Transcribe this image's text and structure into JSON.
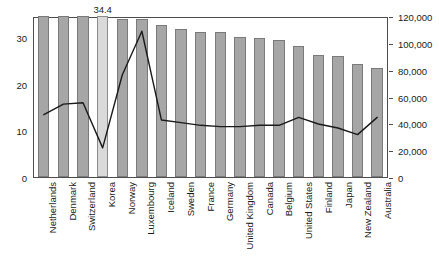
{
  "chart_data": {
    "type": "bar",
    "title": "",
    "subtitle": "",
    "xlabel": "",
    "ylabel": "",
    "categories": [
      "Netherlands",
      "Denmark",
      "Switzerland",
      "Korea",
      "Norway",
      "Luxembourg",
      "Iceland",
      "Sweden",
      "France",
      "Germany",
      "United Kingdom",
      "Canada",
      "Belgium",
      "United States",
      "Finland",
      "Japan",
      "New Zealand",
      "Australia"
    ],
    "grid": false,
    "legend": "none",
    "series": [
      {
        "name": "Bars",
        "chart_type": "bar",
        "axis": "left",
        "ylim": [
          0,
          34.5
        ],
        "yticks": [
          0,
          10,
          20,
          30
        ],
        "ytick_labels": [
          "0",
          "10",
          "20",
          "30"
        ],
        "color": "#a6a6a6",
        "highlight_index": 3,
        "highlight_color": "#d9d9d9",
        "values": [
          34.5,
          34.5,
          34.5,
          34.4,
          33.8,
          33.8,
          32.6,
          31.8,
          31.1,
          31.0,
          30.1,
          29.8,
          29.3,
          28.0,
          26.1,
          26.0,
          24.2,
          23.4
        ],
        "data_labels": {
          "3": "34.4"
        }
      },
      {
        "name": "Line",
        "chart_type": "line",
        "axis": "right",
        "ylim": [
          0,
          120000
        ],
        "yticks": [
          0,
          20000,
          40000,
          60000,
          80000,
          100000,
          120000
        ],
        "ytick_labels": [
          "0",
          "20,000",
          "40,000",
          "60,000",
          "80,000",
          "100,000",
          "120,000"
        ],
        "color": "#1a1a1a",
        "values": [
          47000,
          55000,
          56000,
          22000,
          77000,
          110000,
          43000,
          41000,
          39000,
          38000,
          38000,
          39000,
          39000,
          45000,
          40000,
          37000,
          32000,
          45000
        ]
      }
    ]
  }
}
